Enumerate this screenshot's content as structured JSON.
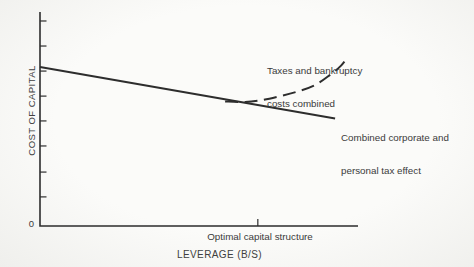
{
  "figure": {
    "y_axis_label": "COST OF CAPITAL",
    "x_axis_label": "LEVERAGE (B/S)",
    "origin_label": "0",
    "optimal_label": "Optimal capital structure",
    "bankruptcy_label_line1": "Taxes and bankruptcy",
    "bankruptcy_label_line2": "costs combined",
    "taxeffect_label_line1": "Combined corporate and",
    "taxeffect_label_line2": "personal tax effect"
  },
  "colors": {
    "line": "#2d2d2d",
    "text": "#3a3a3a",
    "background": "#f9f9f7"
  },
  "chart_data": {
    "type": "line",
    "title": "",
    "xlabel": "LEVERAGE (B/S)",
    "ylabel": "COST OF CAPITAL",
    "axes_unlabeled": true,
    "grid": false,
    "y_ticks_norm": [
      0.958,
      0.841,
      0.724,
      0.607,
      0.491,
      0.374,
      0.252,
      0.136
    ],
    "x_tick": {
      "x_norm": 0.685,
      "label": "Optimal capital structure"
    },
    "series": [
      {
        "name": "Combined corporate and personal tax effect",
        "style": "solid",
        "shape": "straight-declining",
        "points_norm": [
          [
            0.0,
            0.743
          ],
          [
            0.928,
            0.502
          ]
        ]
      },
      {
        "name": "Taxes and bankruptcy costs combined",
        "style": "dashed",
        "shape": "u-curve-rising",
        "points_norm": [
          [
            0.582,
            0.582
          ],
          [
            0.645,
            0.58
          ],
          [
            0.698,
            0.589
          ],
          [
            0.755,
            0.607
          ],
          [
            0.811,
            0.629
          ],
          [
            0.865,
            0.659
          ],
          [
            0.912,
            0.706
          ],
          [
            0.946,
            0.748
          ],
          [
            0.969,
            0.792
          ]
        ]
      }
    ]
  }
}
